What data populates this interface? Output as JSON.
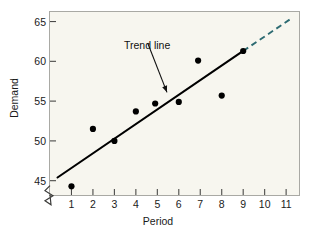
{
  "chart_data": {
    "type": "scatter",
    "title": "",
    "xlabel": "Period",
    "ylabel": "Demand",
    "xlim": [
      0,
      11.6
    ],
    "ylim": [
      43.2,
      66.2
    ],
    "grid": false,
    "legend": "none",
    "x_ticks": [
      "1",
      "2",
      "3",
      "4",
      "5",
      "6",
      "7",
      "8",
      "9",
      "10",
      "11"
    ],
    "y_ticks": [
      "45",
      "50",
      "55",
      "60",
      "65"
    ],
    "y_axis_break": true,
    "points": [
      {
        "x": 1,
        "y": 44.3
      },
      {
        "x": 2,
        "y": 51.5
      },
      {
        "x": 3,
        "y": 50.0
      },
      {
        "x": 4,
        "y": 53.7
      },
      {
        "x": 4.9,
        "y": 54.7
      },
      {
        "x": 6,
        "y": 54.9
      },
      {
        "x": 6.9,
        "y": 60.1
      },
      {
        "x": 8,
        "y": 55.7
      },
      {
        "x": 9,
        "y": 61.3
      }
    ],
    "trend_line": {
      "label": "Trend line",
      "style": "solid",
      "color": "#000000",
      "x_start": 0.35,
      "y_start": 45.4,
      "x_end": 9.0,
      "y_end": 61.3
    },
    "trend_extension": {
      "style": "dashed",
      "color": "#2d6b72",
      "x_start": 9.0,
      "y_start": 61.3,
      "x_end": 11.25,
      "y_end": 65.4
    },
    "annotation": {
      "text": "Trend line",
      "arrow_from_x": 4.55,
      "arrow_from_y": 62.3,
      "arrow_to_x": 5.45,
      "arrow_to_y": 56.1
    }
  },
  "colors": {
    "plot_background": "#f7f6ef",
    "frame": "#a9a9a4",
    "marker": "#000000",
    "trend": "#000000",
    "extension": "#2d6b72",
    "text": "#1a1a1a"
  }
}
